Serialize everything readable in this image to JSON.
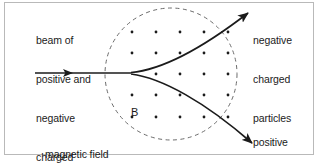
{
  "figure": {
    "background_color": "#ffffff",
    "ink_color": "#1b1b1b",
    "border_color": "#b9b9b9"
  },
  "labels": {
    "beam": {
      "name": "beam-of-particles-label",
      "lines": [
        "beam of",
        "positive and",
        "negative",
        "charged",
        "particles"
      ]
    },
    "negative_out": {
      "name": "negative-charged-particles-label",
      "lines": [
        "negative",
        "charged",
        "particles"
      ]
    },
    "positive_out": {
      "name": "positive-charged-particles-label",
      "lines": [
        "positive",
        "charged",
        "particles"
      ]
    },
    "magnetic_field": {
      "name": "magnetic-field-caption",
      "lines": [
        "magnetic field",
        "(out of paper)"
      ]
    },
    "field_symbol": {
      "name": "b-field-symbol",
      "text": "B"
    }
  },
  "field_region": {
    "shape": "circle",
    "center_x": 171,
    "center_y": 74,
    "radius": 66,
    "stroke": "#6b6b6b",
    "dash": "4,3.5",
    "direction": "out of paper",
    "dot_rows_y": [
      32,
      53,
      74,
      95,
      117
    ],
    "dot_cols_x": [
      132,
      156,
      180,
      204,
      228
    ],
    "dot_radius": 1.4,
    "dot_color": "#1b1b1b"
  },
  "beam": {
    "name": "incoming-beam",
    "start_x": 35,
    "end_x": 131,
    "y": 73,
    "arrowhead_x": 72,
    "stroke": "#1b1b1b",
    "stroke_width": 1.6
  },
  "tracks": [
    {
      "name": "negative-particle-track",
      "charge": "negative",
      "deflection": "upward",
      "path": "M131,72.5 C160,70 200,50 252,10",
      "arrow_tip_x": 253,
      "arrow_tip_y": 9,
      "arrow_angle_deg": -38
    },
    {
      "name": "positive-particle-track",
      "charge": "positive",
      "deflection": "downward",
      "path": "M131,74 C162,78 205,102 256,147",
      "arrow_tip_x": 257,
      "arrow_tip_y": 148,
      "arrow_angle_deg": 41
    }
  ]
}
